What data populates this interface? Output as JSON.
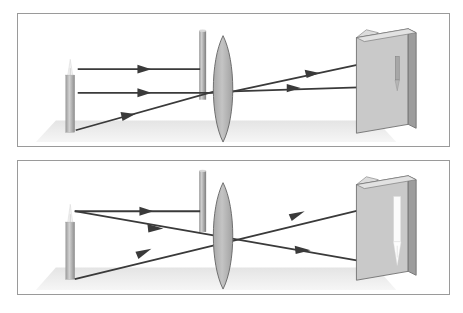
{
  "figure": {
    "background_color": "#ffffff",
    "frame_color": "#9a9a9a",
    "panel_count": 2
  },
  "palette": {
    "ray_color": "#3a3a3a",
    "lens_fill": "#b4b4b4",
    "lens_stroke": "#6e6e6e",
    "barrier_light": "#c9c9c9",
    "barrier_dark": "#8c8c8c",
    "screen_face": "#c9c9c9",
    "screen_edge": "#9d9d9d",
    "screen_stroke": "#707070",
    "candle_body": "#b9b9b9",
    "candle_shade": "#8f8f8f",
    "flame_color": "#f4f4f4",
    "ground_color": "#e9e9e9",
    "image_dark": "#7a7a7a",
    "image_bright": "#fbfbfb"
  },
  "panels": [
    {
      "id": "panel-top",
      "name": "panel-object-beyond-2f",
      "label": "Top panel: small dim inverted image on screen",
      "objects": {
        "candle": {
          "name": "candle-object",
          "x": 48,
          "y": 62,
          "width": 9,
          "height": 58
        },
        "flame": {
          "name": "candle-flame",
          "x": 52,
          "y": 48,
          "height": 16
        },
        "ground": {
          "name": "ground-plane",
          "y": 108,
          "height": 22
        },
        "barrier": {
          "name": "aperture-barrier",
          "x": 182,
          "y": 17,
          "width": 7,
          "height": 70
        },
        "lens": {
          "name": "converging-lens",
          "cx": 206,
          "cy": 76,
          "half_width": 13,
          "half_height": 55
        },
        "screen": {
          "name": "projection-screen",
          "x": 355,
          "y": 18,
          "width": 65,
          "height": 100
        },
        "image": {
          "name": "projected-image-inverted-dim",
          "brightness": "dim",
          "size": "small",
          "orientation": "inverted"
        }
      },
      "rays": [
        {
          "name": "ray-parallel-upper",
          "from": [
            60,
            56
          ],
          "to": [
            183,
            56
          ],
          "arrow_at": 0.55
        },
        {
          "name": "ray-parallel-lower",
          "from": [
            60,
            80
          ],
          "to": [
            190,
            80
          ],
          "arrow_at": 0.55
        },
        {
          "name": "ray-through-center-incident",
          "from": [
            60,
            110
          ],
          "to": [
            206,
            76
          ],
          "arrow_at": 0.55
        },
        {
          "name": "ray-refracted-upper",
          "from": [
            206,
            76
          ],
          "to": [
            400,
            46
          ],
          "arrow_at": 0.6
        },
        {
          "name": "ray-refracted-lower",
          "from": [
            206,
            80
          ],
          "to": [
            400,
            72
          ],
          "arrow_at": 0.6
        }
      ]
    },
    {
      "id": "panel-bottom",
      "name": "panel-object-near-2f",
      "label": "Bottom panel: larger bright inverted image on screen",
      "objects": {
        "candle": {
          "name": "candle-object",
          "x": 48,
          "y": 62,
          "width": 9,
          "height": 58
        },
        "flame": {
          "name": "candle-flame",
          "x": 52,
          "y": 48,
          "height": 16
        },
        "ground": {
          "name": "ground-plane",
          "y": 108,
          "height": 22
        },
        "barrier": {
          "name": "aperture-barrier",
          "x": 182,
          "y": 10,
          "width": 7,
          "height": 62
        },
        "lens": {
          "name": "converging-lens",
          "cx": 206,
          "cy": 76,
          "half_width": 13,
          "half_height": 55
        },
        "screen": {
          "name": "projection-screen",
          "x": 355,
          "y": 18,
          "width": 65,
          "height": 100
        },
        "image": {
          "name": "projected-image-inverted-bright",
          "brightness": "bright",
          "size": "large",
          "orientation": "inverted"
        }
      },
      "rays": [
        {
          "name": "ray-parallel-upper",
          "from": [
            60,
            52
          ],
          "to": [
            183,
            52
          ],
          "arrow_at": 0.55
        },
        {
          "name": "ray-from-tip-downward",
          "from": [
            60,
            52
          ],
          "to": [
            400,
            108
          ],
          "arrow_at": 0.75
        },
        {
          "name": "ray-from-base-upward",
          "from": [
            60,
            115
          ],
          "to": [
            400,
            40
          ],
          "arrow_at": 0.72
        },
        {
          "name": "ray-mid-incident",
          "from": [
            60,
            52
          ],
          "to": [
            206,
            78
          ],
          "arrow_at": 0.7
        }
      ]
    }
  ]
}
